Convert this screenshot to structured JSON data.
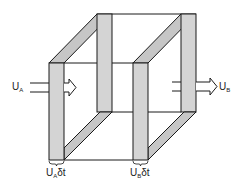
{
  "diagram": {
    "type": "control-volume-flow",
    "colors": {
      "line": "#1a1a1a",
      "slab_fill": "#d4d4d4",
      "slab_diag_fill": "#c6c6c6",
      "background": "#ffffff"
    },
    "labels": {
      "inlet_velocity": {
        "main": "U",
        "sub": "A"
      },
      "outlet_velocity": {
        "main": "U",
        "sub": "B"
      },
      "inlet_slab_thickness": {
        "main": "U",
        "sub": "A",
        "suffix": "δt"
      },
      "outlet_slab_thickness": {
        "main": "U",
        "sub": "B",
        "suffix": "δt"
      }
    },
    "arrows": [
      {
        "name": "inlet-flow-arrow",
        "direction": "right",
        "label": "U_A"
      },
      {
        "name": "outlet-flow-arrow",
        "direction": "right",
        "label": "U_B"
      }
    ]
  }
}
